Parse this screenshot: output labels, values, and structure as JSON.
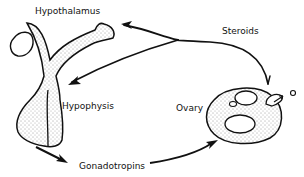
{
  "diagram": {
    "labels": {
      "hypothalamus": "Hypothalamus",
      "hypophysis": "Hypophysis",
      "gonadotropins": "Gonadotropins",
      "ovary": "Ovary",
      "steroids": "Steroids"
    },
    "colors": {
      "stroke": "#111111",
      "background": "#ffffff"
    }
  }
}
